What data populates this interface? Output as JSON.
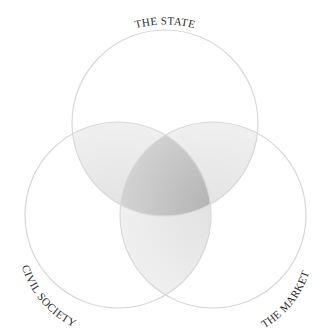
{
  "diagram": {
    "type": "venn",
    "sets": [
      {
        "id": "state",
        "label": "THE STATE"
      },
      {
        "id": "civil",
        "label": "CIVIL SOCIETY"
      },
      {
        "id": "market",
        "label": "THE MARKET"
      }
    ],
    "colors": {
      "circle_stroke": "#d8d8d8",
      "pair_overlap": "#e6e6e6",
      "triple_overlap": "#b9b9b9",
      "background": "#ffffff",
      "label": "#2a2a2a"
    }
  }
}
